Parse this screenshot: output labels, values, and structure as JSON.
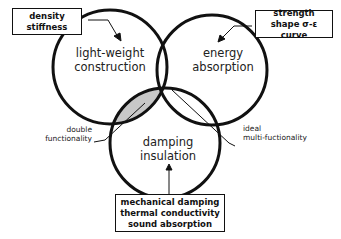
{
  "diagram": {
    "circles": [
      {
        "id": "lightweight",
        "line1": "light-weight",
        "line2": "construction"
      },
      {
        "id": "energy",
        "line1": "energy",
        "line2": "absorption"
      },
      {
        "id": "damping",
        "line1": "damping",
        "line2": "insulation"
      }
    ],
    "boxes": {
      "top_left": {
        "line1": "density",
        "line2": "stiffness"
      },
      "top_right": {
        "line1": "strength",
        "line2": "shape σ-ε curve"
      },
      "bottom": {
        "line1": "mechanical damping",
        "line2": "thermal conductivity",
        "line3": "sound absorption"
      }
    },
    "annotations": {
      "left": {
        "line1": "double",
        "line2": "functionality"
      },
      "right": {
        "line1": "ideal",
        "line2": "multi-fuctionality"
      }
    },
    "colors": {
      "stroke": "#111111",
      "double_overlap_fill": "#c8c8c8",
      "triple_overlap_fill": "#111111"
    }
  }
}
